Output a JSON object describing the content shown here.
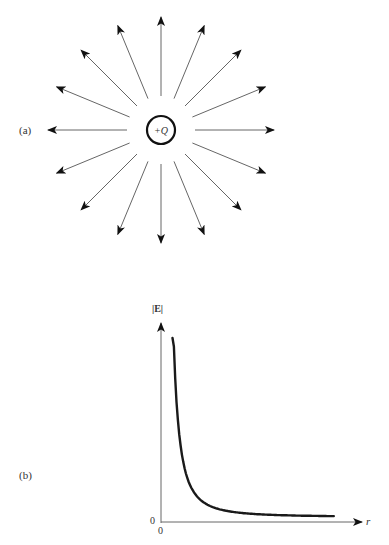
{
  "panel_a": {
    "label": "(a)",
    "charge_label": "+Q",
    "center": [
      161,
      130
    ],
    "charge_radius": 14,
    "field_lines": {
      "count": 16,
      "inner_radius": 34,
      "outer_radius": 113,
      "direction": "outward"
    }
  },
  "panel_b": {
    "label": "(b)",
    "y_axis_label": "|E|",
    "x_axis_label": "r",
    "origin_y_label": "0",
    "origin_x_label": "0"
  },
  "colors": {
    "line": "#666666",
    "arrowhead": "#111111",
    "curve": "#1a1a1a",
    "circle": "#111111"
  },
  "chart_data": {
    "type": "line",
    "title": "",
    "xlabel": "r",
    "ylabel": "|E|",
    "x": [
      0.25,
      0.3,
      0.4,
      0.5,
      0.6,
      0.8,
      1.0,
      1.25,
      1.5,
      2.0,
      2.5,
      3.0,
      3.5,
      4.0
    ],
    "values": [
      16.0,
      11.1,
      6.25,
      4.0,
      2.78,
      1.56,
      1.0,
      0.64,
      0.44,
      0.25,
      0.16,
      0.11,
      0.08,
      0.06
    ],
    "xlim": [
      0,
      4.2
    ],
    "ylim": [
      0,
      17
    ],
    "x_ticks": [
      "0"
    ],
    "y_ticks": [
      "0"
    ],
    "grid": false,
    "legend": null
  }
}
